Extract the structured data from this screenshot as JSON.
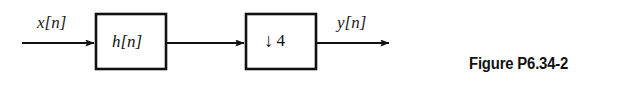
{
  "figure": {
    "caption": "Figure P6.34-2",
    "diagram_type": "signal-processing-block-diagram",
    "colors": {
      "stroke": "#111111",
      "background": "#ffffff",
      "text": "#111111"
    },
    "signals": {
      "input_label": "x[n]",
      "output_label": "y[n]"
    },
    "blocks": [
      {
        "id": "filter",
        "label": "h[n]",
        "description": "LTI filter impulse response"
      },
      {
        "id": "downsampler",
        "arrow_glyph": "↓",
        "factor": "4",
        "label": "↓ 4",
        "description": "downsample by 4"
      }
    ],
    "connections": [
      {
        "id": "input-arrow",
        "from": "source",
        "to": "filter"
      },
      {
        "id": "middle-arrow",
        "from": "filter",
        "to": "downsampler"
      },
      {
        "id": "output-arrow",
        "from": "downsampler",
        "to": "sink"
      }
    ]
  }
}
